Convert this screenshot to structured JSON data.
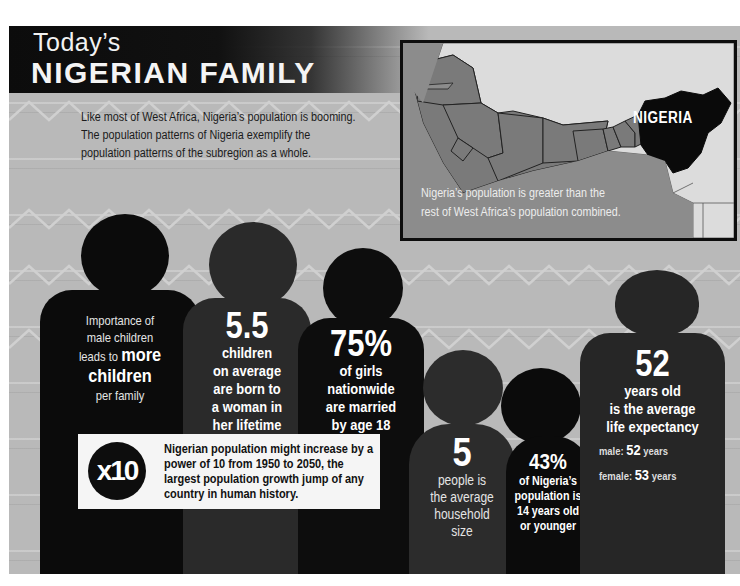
{
  "header": {
    "title_small": "Today’s",
    "title_big": "NIGERIAN FAMILY",
    "intro": "Like most of West Africa, Nigeria’s population is booming. The population patterns of Nigeria exemplify the population patterns of the subregion as a whole."
  },
  "map": {
    "highlight_label": "NIGERIA",
    "caption_line1": "Nigeria’s population is greater than the",
    "caption_line2": "rest of West Africa’s population combined.",
    "colors": {
      "ocean": "#8c8c8c",
      "west_africa": "#7a7a7a",
      "other_land": "#dcdcdc",
      "nigeria": "#0a0a0a"
    }
  },
  "figures": [
    {
      "lines": [
        "Importance of",
        "male children"
      ],
      "emph_pre": "leads to ",
      "emph": "more",
      "emph2": "children",
      "post": "per family"
    },
    {
      "stat": "5.5",
      "lines": [
        "children",
        "on average",
        "are born to",
        "a woman in",
        "her lifetime"
      ]
    },
    {
      "stat": "75%",
      "lines": [
        "of girls",
        "nationwide",
        "are married",
        "by age 18"
      ]
    },
    {
      "stat": "5",
      "lines": [
        "people is",
        "the average",
        "household",
        "size"
      ]
    },
    {
      "stat": "43%",
      "lines": [
        "of Nigeria’s",
        "population is",
        "14 years old",
        "or younger"
      ]
    },
    {
      "stat": "52",
      "lines": [
        "years old",
        "is the average",
        "life expectancy"
      ],
      "male_label": "male:",
      "male_value": "52",
      "male_unit": "years",
      "female_label": "female:",
      "female_value": "53",
      "female_unit": "years"
    }
  ],
  "callout": {
    "badge": "x10",
    "text": "Nigerian population might increase by a power of 10 from 1950 to 2050, the largest population growth jump of any country in human history."
  }
}
